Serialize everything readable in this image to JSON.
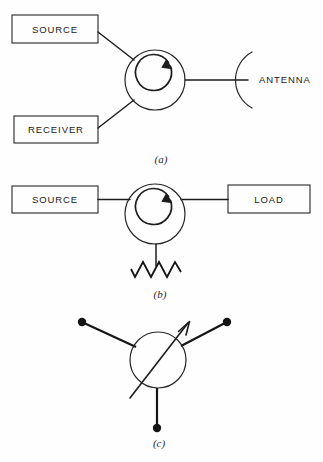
{
  "figure": {
    "width": 323,
    "height": 462,
    "background_color": "#fefefe",
    "line_color": "#1d1d1d"
  },
  "panels": [
    {
      "caption": "(a)",
      "description": "Circulator used as a radar duplexer connecting source and receiver to an antenna",
      "boxes": [
        {
          "label": "SOURCE",
          "x": 12,
          "y": 15,
          "width": 86,
          "height": 28
        },
        {
          "label": "RECEIVER",
          "x": 14,
          "y": 116,
          "width": 84,
          "height": 27
        }
      ],
      "circulator": {
        "cx": 155,
        "cy": 80,
        "r": 30,
        "rotation": "clockwise"
      },
      "antenna": {
        "label": "ANTENNA",
        "arc_x": 248,
        "arc_cy": 80
      },
      "caption_x": 161,
      "caption_y": 160
    },
    {
      "caption": "(b)",
      "description": "Circulator used as an isolator with a matched resistive load to ground",
      "boxes": [
        {
          "label": "SOURCE",
          "x": 12,
          "y": 186,
          "width": 86,
          "height": 27
        },
        {
          "label": "LOAD",
          "x": 228,
          "y": 185,
          "width": 82,
          "height": 28
        }
      ],
      "circulator": {
        "cx": 155,
        "cy": 214,
        "r": 30,
        "rotation": "clockwise"
      },
      "resistor": {
        "cx": 156,
        "y_top": 262,
        "y_bottom": 277,
        "peaks": 6
      },
      "caption_x": 160,
      "caption_y": 295
    },
    {
      "caption": "(c)",
      "description": "Three-port circulator schematic symbol with directional arrow",
      "circulator": {
        "cx": 158,
        "cy": 360,
        "r": 28
      },
      "terminals": [
        {
          "name": "upper-left-terminal",
          "dot_x": 82,
          "dot_y": 322
        },
        {
          "name": "upper-right-terminal",
          "dot_x": 227,
          "dot_y": 322
        },
        {
          "name": "bottom-terminal",
          "dot_x": 157,
          "dot_y": 428
        }
      ],
      "arrow": {
        "x1": 130,
        "y1": 398,
        "x2": 190,
        "y2": 322,
        "direction": "upper-right"
      },
      "caption_x": 159,
      "caption_y": 444
    }
  ]
}
